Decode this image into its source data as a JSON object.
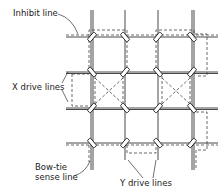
{
  "diagram": {
    "title": "",
    "labels": {
      "inhibit_line": "Inhibit line",
      "x_drive_lines": "X drive lines",
      "bow_tie_sense_line": "Bow-tie sense line",
      "bow_tie_line1": "Bow-tie",
      "bow_tie_line2": "sense line",
      "y_drive_lines": "Y drive lines"
    },
    "grid": {
      "columns": 4,
      "rows": 4,
      "x_positions": [
        91,
        125,
        158,
        192
      ],
      "y_positions": [
        37,
        72,
        108,
        143
      ]
    },
    "elements": [
      {
        "type": "vertical-drive-lines",
        "count": 4,
        "name": "Y drive lines"
      },
      {
        "type": "horizontal-drive-lines",
        "count": 4,
        "name": "X drive lines"
      },
      {
        "type": "ferrite-cores",
        "count": 16,
        "at": "every intersection"
      },
      {
        "type": "dashed-line",
        "name": "Inhibit line"
      },
      {
        "type": "dashed-line",
        "name": "Bow-tie sense line",
        "crossings": 2
      }
    ]
  }
}
